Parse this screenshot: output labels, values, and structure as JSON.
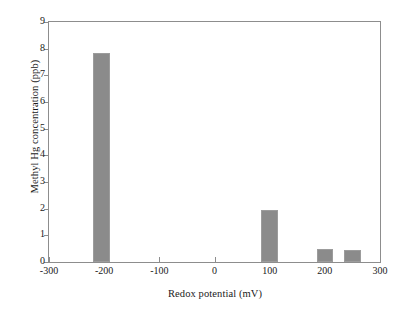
{
  "chart_data": {
    "type": "bar",
    "title": "",
    "xlabel": "Redox potential (mV)",
    "ylabel": "Methyl Hg concentration (ppb)",
    "xlim": [
      -300,
      300
    ],
    "ylim": [
      0,
      9
    ],
    "grid": false,
    "legend": null,
    "bar_color": "#8b8b8b",
    "frame_color": "#8d8d8d",
    "xticks": [
      -300,
      -200,
      -100,
      0,
      100,
      200,
      300
    ],
    "xtick_labels": [
      "-300",
      "-200",
      "-100",
      "0",
      "100",
      "200",
      "300"
    ],
    "yticks": [
      0,
      1,
      2,
      3,
      4,
      5,
      6,
      7,
      8,
      9
    ],
    "ytick_labels": [
      "0",
      "1",
      "2",
      "3",
      "4",
      "5",
      "6",
      "7",
      "8",
      "9"
    ],
    "x": [
      -205,
      100,
      200,
      250
    ],
    "values": [
      7.85,
      1.95,
      0.5,
      0.45
    ],
    "bar_width_mv": 30,
    "points": [
      {
        "x": -205,
        "y": 7.85
      },
      {
        "x": 100,
        "y": 1.95
      },
      {
        "x": 200,
        "y": 0.5
      },
      {
        "x": 250,
        "y": 0.45
      }
    ]
  }
}
